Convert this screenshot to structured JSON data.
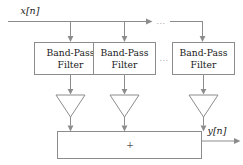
{
  "diagram": {
    "input_label": "x[n]",
    "output_label": "y[n]",
    "sum_symbol": "+",
    "ellipsis": "...",
    "line_color": "#8c8c8c",
    "text_color": "#1a1a1a",
    "background": "#ffffff",
    "filters": [
      {
        "line1": "Band-Pass",
        "line2": "Filter"
      },
      {
        "line1": "Band-Pass",
        "line2": "Filter"
      },
      {
        "line1": "Band-Pass",
        "line2": "Filter"
      }
    ],
    "gains": [
      {
        "name": "gain-triangle-1"
      },
      {
        "name": "gain-triangle-2"
      },
      {
        "name": "gain-triangle-3"
      }
    ],
    "ellipsis_top": "...",
    "ellipsis_middle": "..."
  }
}
